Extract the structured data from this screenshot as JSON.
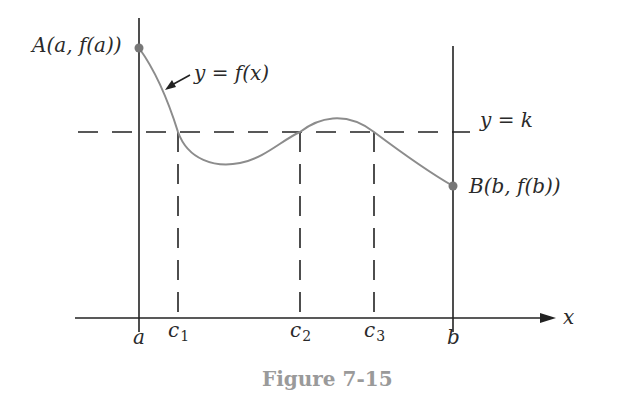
{
  "figure": {
    "caption": "Figure 7-15",
    "curve_label": "y = f(x)",
    "level_label": "y = k",
    "point_a_label": "A(a, f(a))",
    "point_b_label": "B(b, f(b))",
    "axis_label_x": "x",
    "tick_labels": {
      "a": "a",
      "c1_base": "c",
      "c1_sub": "1",
      "c2_base": "c",
      "c2_sub": "2",
      "c3_base": "c",
      "c3_sub": "3",
      "b": "b"
    }
  },
  "colors": {
    "axes": "#222222",
    "curve": "#8c8c8c",
    "points": "#777777",
    "caption": "#9a9a9a"
  }
}
